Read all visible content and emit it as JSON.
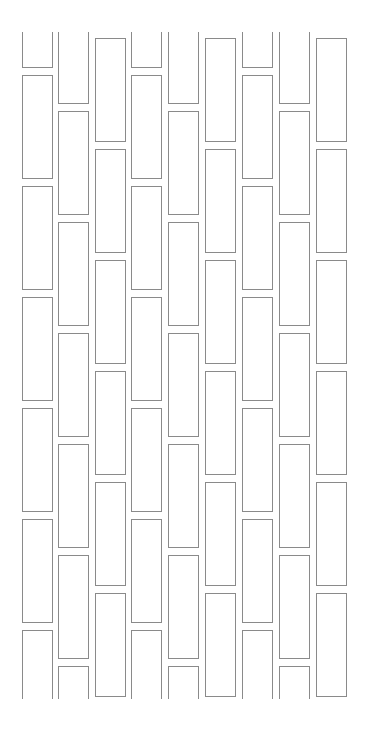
{
  "pattern": {
    "clip_top": 32,
    "clip_bottom": 699,
    "stroke_color": "#8a8a8a",
    "background": "#ffffff",
    "brick_height": 104,
    "period": 111,
    "columns": [
      {
        "x": 22,
        "w": 31,
        "phase": 68
      },
      {
        "x": 58,
        "w": 31,
        "phase": 104
      },
      {
        "x": 95,
        "w": 31,
        "phase": 142
      },
      {
        "x": 131,
        "w": 31,
        "phase": 68
      },
      {
        "x": 168,
        "w": 31,
        "phase": 104
      },
      {
        "x": 205,
        "w": 31,
        "phase": 142
      },
      {
        "x": 242,
        "w": 31,
        "phase": 68
      },
      {
        "x": 279,
        "w": 31,
        "phase": 104
      },
      {
        "x": 316,
        "w": 31,
        "phase": 142
      }
    ]
  }
}
